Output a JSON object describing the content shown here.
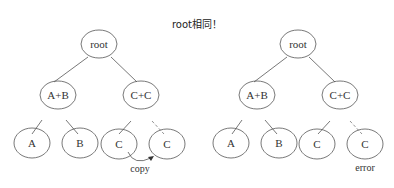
{
  "title": "root相同！",
  "trees": [
    {
      "name": "left",
      "nodes": {
        "root": "root",
        "ab": "A+B",
        "cc": "C+C",
        "a": "A",
        "b": "B",
        "c1": "C",
        "c2": "C"
      },
      "annotation": "copy"
    },
    {
      "name": "right",
      "nodes": {
        "root": "root",
        "ab": "A+B",
        "cc": "C+C",
        "a": "A",
        "b": "B",
        "c1": "C",
        "c2": "C"
      },
      "annotation": "error"
    }
  ],
  "colors": {
    "stroke": "#555555",
    "dashed": "#777777",
    "text": "#333333"
  }
}
